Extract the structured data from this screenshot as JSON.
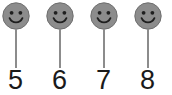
{
  "diagram": {
    "background_color": "#ffffff",
    "face_fill_color": "#8c8c8c",
    "face_rim_color": "#6e6e6e",
    "feature_color": "#1f1f1f",
    "stem_color": "#8c8c8c",
    "label_color": "#1a1a1a",
    "items": [
      {
        "label": "5",
        "icon": "smiley-face-icon"
      },
      {
        "label": "6",
        "icon": "smiley-face-icon"
      },
      {
        "label": "7",
        "icon": "smiley-face-icon"
      },
      {
        "label": "8",
        "icon": "smiley-face-icon"
      }
    ]
  }
}
